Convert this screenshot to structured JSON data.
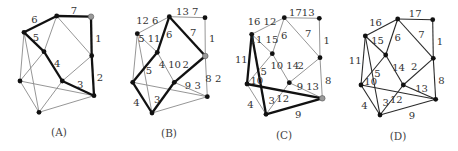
{
  "figure": {
    "node_ids": [
      "TC",
      "TR",
      "LU",
      "M",
      "RM",
      "LL",
      "CL",
      "RL",
      "B"
    ],
    "edges": [
      [
        "TC",
        "TR"
      ],
      [
        "TR",
        "RM"
      ],
      [
        "RM",
        "RL"
      ],
      [
        "TC",
        "LU"
      ],
      [
        "TC",
        "M"
      ],
      [
        "TC",
        "RM"
      ],
      [
        "LU",
        "M"
      ],
      [
        "M",
        "CL"
      ],
      [
        "CL",
        "RM"
      ],
      [
        "CL",
        "RL"
      ],
      [
        "LU",
        "LL"
      ],
      [
        "LU",
        "B"
      ],
      [
        "M",
        "LL"
      ],
      [
        "LL",
        "RL"
      ],
      [
        "LL",
        "B"
      ],
      [
        "CL",
        "B"
      ],
      [
        "B",
        "RL"
      ]
    ],
    "panels": [
      {
        "caption": "(A)",
        "default_style": "thin",
        "highlighted_node": "TR",
        "thick_edges": [
          0,
          1,
          2,
          3,
          6,
          7,
          9
        ],
        "edge_labels": {
          "0": "7",
          "1": "1",
          "2": "2",
          "3": "6",
          "6": "5",
          "7": "4",
          "9": "3"
        }
      },
      {
        "caption": "(B)",
        "default_style": "thin",
        "highlighted_node": "RM",
        "thick_edges": [
          4,
          5,
          8,
          12,
          14,
          15
        ],
        "edge_labels": {
          "0": "13 7",
          "1": "1",
          "2": "8 2",
          "3": "12 6",
          "4": "6",
          "5": "7",
          "6": "5 11",
          "7": "4 10",
          "8": "2",
          "9": "9 3",
          "12": "5",
          "14": "4",
          "15": "3"
        }
      },
      {
        "caption": "(C)",
        "default_style": "thin",
        "highlighted_node": "RL",
        "thick_edges": [
          10,
          11,
          13,
          16
        ],
        "edge_labels": {
          "0": "1713",
          "1": "1",
          "2": "8",
          "3": "16 12",
          "4": "6",
          "5": "7",
          "6": "11 15",
          "7": "10 14",
          "8": "2",
          "9": "9 13",
          "10": "11",
          "11": "10",
          "12": "5",
          "13": "12",
          "14": "4",
          "15": "3",
          "16": "9"
        }
      },
      {
        "caption": "(D)",
        "default_style": "medium",
        "highlighted_node": null,
        "thick_edges": [],
        "edge_labels": {
          "0": "17",
          "1": "1",
          "2": "8",
          "3": "16",
          "4": "6",
          "5": "7",
          "6": "15",
          "7": "14",
          "8": "2",
          "9": "13",
          "10": "11",
          "11": "10",
          "12": "5",
          "13": "12",
          "14": "4",
          "15": "3",
          "16": "9"
        }
      }
    ]
  }
}
